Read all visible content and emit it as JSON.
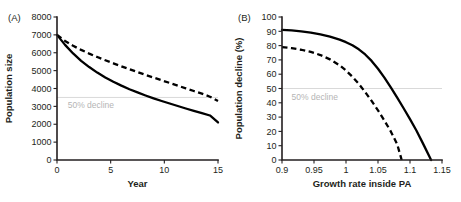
{
  "figure": {
    "background": "#ffffff",
    "curve_color": "#000000",
    "axis_color": "#231f20",
    "reference_line_color": "#d9d9d9",
    "reference_label_color": "#b5b5b5"
  },
  "chart_data": [
    {
      "type": "line",
      "panel_label": "(A)",
      "title": "",
      "xlabel": "Year",
      "ylabel": "Population size",
      "xlim": [
        0,
        15
      ],
      "ylim": [
        0,
        8000
      ],
      "xticks": [
        0,
        5,
        10,
        15
      ],
      "xtick_labels": [
        "0",
        "5",
        "10",
        "15"
      ],
      "yticks": [
        0,
        1000,
        2000,
        3000,
        4000,
        5000,
        6000,
        7000,
        8000
      ],
      "ytick_labels": [
        "0",
        "1000",
        "2000",
        "3000",
        "4000",
        "5000",
        "6000",
        "7000",
        "8000"
      ],
      "grid": false,
      "legend": "none",
      "annotations": [
        {
          "text": "50% decline",
          "kind": "reference-line-label",
          "y_value": 3500,
          "x_value": 1.0
        }
      ],
      "reference_lines": [
        {
          "orientation": "horizontal",
          "value": 3500,
          "label": "50% decline"
        }
      ],
      "series": [
        {
          "name": "solid",
          "style": "solid",
          "x": [
            0,
            0.75,
            1.5,
            2.25,
            3,
            3.75,
            4.5,
            5.25,
            6,
            6.75,
            7.5,
            8.25,
            9,
            9.75,
            10.5,
            11.25,
            12,
            12.75,
            13.5,
            14.25,
            15
          ],
          "values": [
            7000,
            6440,
            5960,
            5550,
            5200,
            4890,
            4620,
            4380,
            4160,
            3960,
            3780,
            3610,
            3450,
            3300,
            3160,
            3020,
            2880,
            2750,
            2620,
            2490,
            2100
          ]
        },
        {
          "name": "dashed",
          "style": "dashed",
          "x": [
            0,
            0.75,
            1.5,
            2.25,
            3,
            3.75,
            4.5,
            5.25,
            6,
            6.75,
            7.5,
            8.25,
            9,
            9.75,
            10.5,
            11.25,
            12,
            12.75,
            13.5,
            14.25,
            15
          ],
          "values": [
            7000,
            6660,
            6390,
            6160,
            5950,
            5760,
            5580,
            5410,
            5240,
            5080,
            4920,
            4760,
            4610,
            4460,
            4310,
            4160,
            4010,
            3860,
            3710,
            3540,
            3300
          ]
        }
      ]
    },
    {
      "type": "line",
      "panel_label": "(B)",
      "title": "",
      "xlabel": "Growth rate inside PA",
      "ylabel": "Population decline (%)",
      "xlim": [
        0.9,
        1.15
      ],
      "ylim": [
        0,
        100
      ],
      "xticks": [
        0.9,
        0.95,
        1,
        1.05,
        1.1,
        1.15
      ],
      "xtick_labels": [
        "0.9",
        "0.95",
        "1",
        "1.05",
        "1.1",
        "1.15"
      ],
      "yticks": [
        0,
        10,
        20,
        30,
        40,
        50,
        60,
        70,
        80,
        90,
        100
      ],
      "ytick_labels": [
        "0",
        "10",
        "20",
        "30",
        "40",
        "50",
        "60",
        "70",
        "80",
        "90",
        "100"
      ],
      "grid": false,
      "legend": "none",
      "annotations": [
        {
          "text": "50% decline",
          "kind": "reference-line-label",
          "y_value": 50,
          "x_value": 0.915
        }
      ],
      "reference_lines": [
        {
          "orientation": "horizontal",
          "value": 50,
          "label": "50% decline"
        }
      ],
      "series": [
        {
          "name": "solid",
          "style": "solid",
          "x": [
            0.9,
            0.915,
            0.93,
            0.945,
            0.96,
            0.975,
            0.99,
            1.0,
            1.01,
            1.02,
            1.03,
            1.04,
            1.05,
            1.06,
            1.07,
            1.08,
            1.09,
            1.1,
            1.11,
            1.12,
            1.133
          ],
          "values": [
            91,
            90.6,
            90,
            89.1,
            87.9,
            86.3,
            84.2,
            82.4,
            80.2,
            77.4,
            73.8,
            69.3,
            63.8,
            57.6,
            50.8,
            43.6,
            36.2,
            28.6,
            20.6,
            11.8,
            0
          ]
        },
        {
          "name": "dashed",
          "style": "dashed",
          "x": [
            0.9,
            0.915,
            0.93,
            0.945,
            0.96,
            0.975,
            0.99,
            1.0,
            1.01,
            1.02,
            1.03,
            1.04,
            1.05,
            1.06,
            1.07,
            1.08,
            1.087
          ],
          "values": [
            79,
            78.2,
            77.1,
            75.6,
            73.4,
            70.4,
            66.2,
            62.6,
            58.2,
            53.2,
            47.5,
            41.3,
            34.7,
            27.6,
            20.0,
            11.0,
            0
          ]
        }
      ]
    }
  ]
}
